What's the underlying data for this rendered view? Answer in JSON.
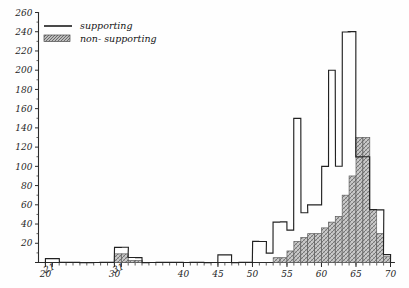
{
  "chart_data": {
    "type": "bar",
    "title": "",
    "subtitle": "",
    "xlabel": "",
    "ylabel": "",
    "xlim": [
      19,
      70
    ],
    "ylim": [
      0,
      260
    ],
    "grid": false,
    "legend_position": "top-left",
    "y_ticks": [
      0,
      20,
      40,
      60,
      80,
      100,
      120,
      140,
      160,
      180,
      200,
      220,
      240,
      260
    ],
    "y_tick_labels": [
      "",
      "20",
      "40",
      "60",
      "80",
      "100",
      "120",
      "140",
      "160",
      "180",
      "200",
      "220",
      "240",
      "260"
    ],
    "x_ticks": [
      20,
      21,
      30,
      31,
      40,
      45,
      50,
      55,
      60,
      65,
      70
    ],
    "x_tick_labels": [
      "20",
      "21",
      "30",
      "31",
      "40",
      "45",
      "50",
      "55",
      "60",
      "65",
      "70"
    ],
    "bin_width": 1,
    "categories": [
      20,
      21,
      22,
      23,
      24,
      25,
      26,
      27,
      28,
      29,
      30,
      31,
      32,
      33,
      34,
      35,
      36,
      37,
      38,
      39,
      40,
      41,
      42,
      43,
      44,
      45,
      46,
      47,
      48,
      49,
      50,
      51,
      52,
      53,
      54,
      55,
      56,
      57,
      58,
      59,
      60,
      61,
      62,
      63,
      64,
      65,
      66,
      67,
      68,
      69
    ],
    "series": [
      {
        "name": "supporting",
        "style": "outline",
        "color": "#222222",
        "values": [
          4,
          4,
          0,
          0,
          0,
          0,
          0,
          0,
          0,
          0,
          16,
          16,
          5,
          5,
          0,
          0,
          0,
          0,
          0,
          0,
          0,
          0,
          0,
          0,
          0,
          8,
          8,
          0,
          0,
          0,
          22,
          22,
          10,
          42,
          42,
          34,
          150,
          52,
          60,
          60,
          100,
          200,
          100,
          240,
          240,
          110,
          110,
          55,
          55,
          8
        ]
      },
      {
        "name": "non- supporting",
        "style": "hatched",
        "color": "#8f8f8f",
        "values": [
          0,
          0,
          0,
          0,
          0,
          0,
          0,
          0,
          0,
          0,
          9,
          9,
          2,
          2,
          0,
          0,
          0,
          0,
          0,
          0,
          0,
          0,
          0,
          0,
          0,
          0,
          0,
          0,
          0,
          0,
          0,
          0,
          0,
          5,
          5,
          12,
          22,
          26,
          30,
          30,
          36,
          42,
          48,
          70,
          90,
          130,
          130,
          55,
          30,
          6
        ]
      }
    ]
  },
  "legend": {
    "items": [
      {
        "label": "supporting",
        "swatch": "line"
      },
      {
        "label": "non- supporting",
        "swatch": "hatch"
      }
    ]
  }
}
